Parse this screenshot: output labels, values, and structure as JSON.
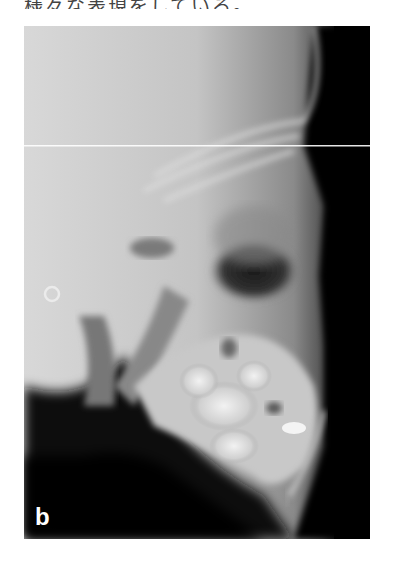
{
  "document": {
    "top_text": "様々な表現をしている。",
    "figure": {
      "type": "lateral cephalometric radiograph",
      "label": "b",
      "colors": {
        "background": "#000000",
        "bone_light": "#e6e6e6",
        "soft_tissue": "#8a8a8a",
        "label": "#ffffff"
      }
    }
  }
}
